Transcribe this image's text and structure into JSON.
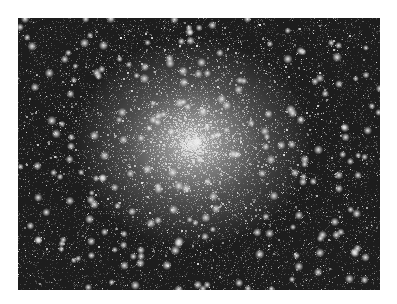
{
  "image": {
    "subject": "Globular star cluster",
    "alt": "Dense globular star cluster with bright white core on dark background",
    "colors": {
      "background": "#1a1a1a",
      "core": "#ebebeb",
      "page": "#ffffff"
    }
  }
}
